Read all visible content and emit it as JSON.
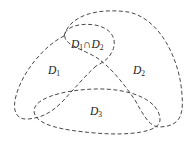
{
  "diagram": {
    "type": "set-regions",
    "regions": [
      {
        "id": "D1",
        "label": "D",
        "sub": "1"
      },
      {
        "id": "D2",
        "label": "D",
        "sub": "2"
      },
      {
        "id": "D3",
        "label": "D",
        "sub": "3"
      },
      {
        "id": "D1nD2",
        "label_a": "D",
        "sub_a": "1",
        "op": "∩",
        "label_b": "D",
        "sub_b": "2"
      }
    ],
    "line_style": "dashed",
    "line_color": "#333333"
  }
}
